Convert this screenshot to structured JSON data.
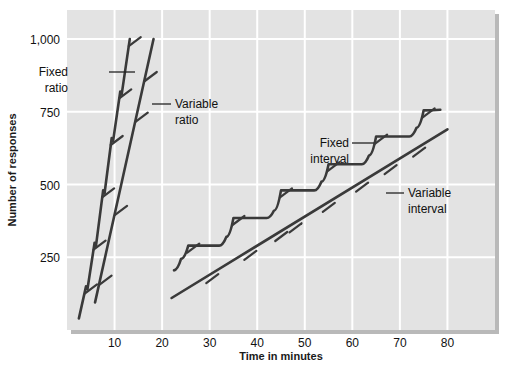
{
  "chart_data": {
    "type": "line",
    "title": "",
    "subtitle": "",
    "xlabel": "Time in minutes",
    "ylabel": "Number of responses",
    "xlim": [
      0,
      90
    ],
    "ylim": [
      0,
      1100
    ],
    "xticks": [
      10,
      20,
      30,
      40,
      50,
      60,
      70,
      80
    ],
    "xticklabels": [
      "10",
      "20",
      "30",
      "40",
      "50",
      "60",
      "70",
      "80"
    ],
    "yticks": [
      250,
      500,
      750,
      1000
    ],
    "yticklabels": [
      "250",
      "500",
      "750",
      "1,000"
    ],
    "grid": true,
    "grid_color": "#ffffff",
    "plot_background": "#e3e3e3",
    "line_color": "#3a3a3a",
    "legend_position": "inline-callouts",
    "series": [
      {
        "name": "Fixed ratio",
        "label": "Fixed ratio",
        "label_line1": "Fixed",
        "label_line2": "ratio",
        "description": "Steep staircase: rapid responding with brief post-reinforcement pauses",
        "x": [
          2.5,
          4.0,
          4.3,
          5.8,
          6.1,
          7.6,
          7.9,
          9.4,
          9.7,
          11.2,
          11.5,
          13.2
        ],
        "y": [
          40,
          150,
          140,
          300,
          290,
          480,
          470,
          660,
          650,
          820,
          810,
          1000
        ]
      },
      {
        "name": "Variable ratio",
        "label": "Variable ratio",
        "label_line1": "Variable",
        "label_line2": "ratio",
        "description": "Steady high steep rate, no pauses",
        "x": [
          5.9,
          18.2
        ],
        "y": [
          95,
          1000
        ]
      },
      {
        "name": "Fixed interval",
        "label": "Fixed interval",
        "label_line1": "Fixed",
        "label_line2": "interval",
        "description": "Scalloped pattern: pause after reinforcement then accelerating responding",
        "x": [
          22.5,
          24.0,
          25.5,
          32.0,
          33.5,
          35.0,
          42.0,
          43.5,
          45.0,
          52.0,
          53.5,
          55.0,
          62.0,
          63.5,
          65.0,
          72.0,
          73.5,
          75.0,
          78.5
        ],
        "y": [
          205,
          245,
          290,
          290,
          320,
          385,
          385,
          410,
          480,
          480,
          510,
          570,
          570,
          600,
          665,
          665,
          695,
          755,
          757
        ]
      },
      {
        "name": "Variable interval",
        "label": "Variable interval",
        "label_line1": "Variable",
        "label_line2": "interval",
        "description": "Steady moderate constant rate",
        "x": [
          22.0,
          80.0
        ],
        "y": [
          110,
          690
        ]
      }
    ],
    "reinforcement_marks": {
      "description": "Short hash marks crossing each curve indicate delivery of a reinforcer",
      "fixed_ratio": [
        150,
        300,
        480,
        660,
        820,
        1000
      ],
      "variable_ratio": [
        180,
        420,
        740,
        880
      ],
      "fixed_interval": [
        290,
        385,
        480,
        570,
        665,
        755
      ],
      "variable_interval": [
        185,
        265,
        330,
        360,
        430,
        500,
        560,
        620
      ]
    }
  },
  "callouts": [
    {
      "id": "fixed-ratio",
      "line1": "Fixed",
      "line2": "ratio"
    },
    {
      "id": "variable-ratio",
      "line1": "Variable",
      "line2": "ratio"
    },
    {
      "id": "fixed-interval",
      "line1": "Fixed",
      "line2": "interval"
    },
    {
      "id": "variable-interval",
      "line1": "Variable",
      "line2": "interval"
    }
  ],
  "axes": {
    "x_title": "Time in minutes",
    "y_title": "Number of responses"
  }
}
